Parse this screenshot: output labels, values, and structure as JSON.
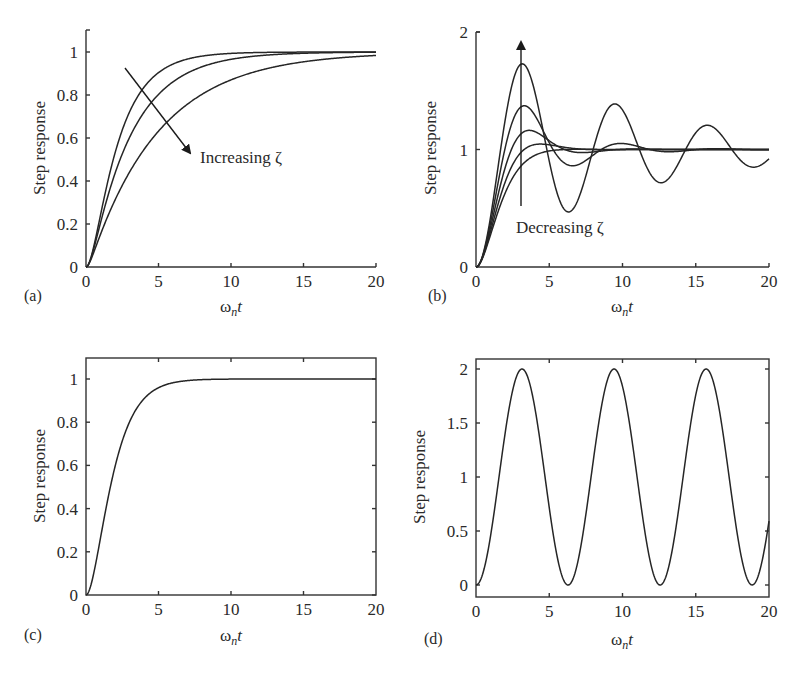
{
  "figure": {
    "width": 801,
    "height": 673,
    "line_color": "#262626",
    "text_color": "#2a2a2a"
  },
  "chart_data": [
    {
      "id": "a",
      "type": "line",
      "panel_label": "(a)",
      "title": "",
      "xlabel_main": "ω",
      "xlabel_sub": "n",
      "xlabel_tail": "t",
      "ylabel": "Step response",
      "xlim": [
        0,
        20
      ],
      "ylim": [
        0,
        1.1
      ],
      "xticks": [
        0,
        5,
        10,
        15,
        20
      ],
      "xtick_labels": [
        "0",
        "5",
        "10",
        "15",
        "20"
      ],
      "yticks": [
        0,
        0.2,
        0.4,
        0.6,
        0.8,
        1
      ],
      "ytick_labels": [
        "0",
        "0.2",
        "0.4",
        "0.6",
        "0.8",
        "1"
      ],
      "box": false,
      "grid": false,
      "description": "Overdamped second-order step responses",
      "series": [
        {
          "name": "zeta ≈ 1.2",
          "zeta": 1.2
        },
        {
          "name": "zeta ≈ 1.6",
          "zeta": 1.6
        },
        {
          "name": "zeta ≈ 2.5",
          "zeta": 2.5
        }
      ],
      "annotation": {
        "text": "Increasing ζ",
        "arrow": "diagonal, down-right",
        "arrow_from": [
          125,
          68
        ],
        "arrow_to": [
          192,
          155
        ],
        "text_pos": [
          200,
          163
        ]
      },
      "plot_area": {
        "x0": 86,
        "x1": 376,
        "y_top": 30,
        "y_bottom": 267,
        "y_at_zero": 267,
        "y_at_one": 52
      }
    },
    {
      "id": "b",
      "type": "line",
      "panel_label": "(b)",
      "title": "",
      "xlabel_main": "ω",
      "xlabel_sub": "n",
      "xlabel_tail": "t",
      "ylabel": "Step response",
      "xlim": [
        0,
        20
      ],
      "ylim": [
        0,
        2
      ],
      "xticks": [
        0,
        5,
        10,
        15,
        20
      ],
      "xtick_labels": [
        "0",
        "5",
        "10",
        "15",
        "20"
      ],
      "yticks": [
        0,
        1,
        2
      ],
      "ytick_labels": [
        "0",
        "1",
        "2"
      ],
      "box": false,
      "grid": false,
      "description": "Underdamped second-order step responses",
      "series": [
        {
          "name": "zeta ≈ 0.1",
          "zeta": 0.1,
          "peak": 1.73
        },
        {
          "name": "zeta ≈ 0.3",
          "zeta": 0.3,
          "peak": 1.37
        },
        {
          "name": "zeta ≈ 0.5",
          "zeta": 0.5,
          "peak": 1.16
        },
        {
          "name": "zeta ≈ 0.7",
          "zeta": 0.7,
          "peak": 1.05
        },
        {
          "name": "zeta ≈ 0.9",
          "zeta": 0.9,
          "peak": 1.0
        }
      ],
      "annotation": {
        "text": "Decreasing ζ",
        "arrow": "vertical, upward",
        "arrow_from": [
          521,
          206
        ],
        "arrow_to": [
          521,
          40
        ],
        "text_pos": [
          516,
          233
        ]
      },
      "plot_area": {
        "x0": 476,
        "x1": 769,
        "y_top": 32,
        "y_bottom": 267,
        "y_at_zero": 267,
        "y_at_one": 149.5
      }
    },
    {
      "id": "c",
      "type": "line",
      "panel_label": "(c)",
      "title": "",
      "xlabel_main": "ω",
      "xlabel_sub": "n",
      "xlabel_tail": "t",
      "ylabel": "Step response",
      "xlim": [
        0,
        20
      ],
      "ylim": [
        0,
        1.1
      ],
      "xticks": [
        0,
        5,
        10,
        15,
        20
      ],
      "xtick_labels": [
        "0",
        "5",
        "10",
        "15",
        "20"
      ],
      "yticks": [
        0,
        0.2,
        0.4,
        0.6,
        0.8,
        1
      ],
      "ytick_labels": [
        "0",
        "0.2",
        "0.4",
        "0.6",
        "0.8",
        "1"
      ],
      "box": true,
      "grid": false,
      "description": "Critically damped second-order step response",
      "series": [
        {
          "name": "zeta = 1",
          "zeta": 1.0
        }
      ],
      "plot_area": {
        "x0": 86,
        "x1": 376,
        "y_top": 358,
        "y_bottom": 595,
        "y_at_zero": 595,
        "y_at_one": 379
      }
    },
    {
      "id": "d",
      "type": "line",
      "panel_label": "(d)",
      "title": "",
      "xlabel_main": "ω",
      "xlabel_sub": "n",
      "xlabel_tail": "t",
      "ylabel": "Step response",
      "xlim": [
        0,
        20
      ],
      "ylim": [
        -0.1,
        2.1
      ],
      "xticks": [
        0,
        5,
        10,
        15,
        20
      ],
      "xtick_labels": [
        "0",
        "5",
        "10",
        "15",
        "20"
      ],
      "yticks": [
        0,
        0.5,
        1,
        1.5,
        2
      ],
      "ytick_labels": [
        "0",
        "0.5",
        "1",
        "1.5",
        "2"
      ],
      "box": true,
      "grid": false,
      "description": "Undamped second-order step response (1 - cos ωn t)",
      "series": [
        {
          "name": "zeta = 0",
          "zeta": 0.0,
          "peaks_at_x": [
            3.14,
            9.42,
            15.71
          ],
          "troughs_at_x": [
            6.28,
            12.57,
            18.85
          ]
        }
      ],
      "plot_area": {
        "x0": 476,
        "x1": 769,
        "y_top": 359,
        "y_bottom": 597,
        "y_at_zero": 585,
        "y_at_one": 477
      }
    }
  ]
}
